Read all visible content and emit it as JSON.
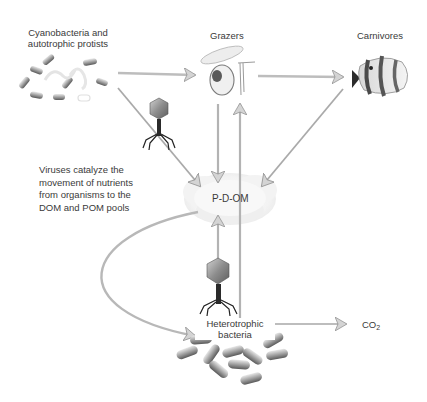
{
  "diagram": {
    "nodes": {
      "cyanobacteria": {
        "line1": "Cyanobacteria and",
        "line2": "autotrophic protists"
      },
      "grazers": {
        "label": "Grazers"
      },
      "carnivores": {
        "label": "Carnivores"
      },
      "pdom": {
        "label": "P-D-OM"
      },
      "heterotrophic": {
        "line1": "Heterotrophic",
        "line2": "bacteria"
      },
      "co2": {
        "base": "CO",
        "sub": "2"
      }
    },
    "annotation": {
      "line1": "Viruses catalyze the",
      "line2": "movement of nutrients",
      "line3": "from organisms to the",
      "line4": "DOM and POM pools"
    },
    "edges": [
      {
        "from": "cyanobacteria",
        "to": "grazers"
      },
      {
        "from": "grazers",
        "to": "carnivores"
      },
      {
        "from": "cyanobacteria",
        "to": "pdom",
        "via": "virus"
      },
      {
        "from": "grazers",
        "to": "pdom"
      },
      {
        "from": "carnivores",
        "to": "pdom"
      },
      {
        "from": "heterotrophic",
        "to": "grazers"
      },
      {
        "from": "heterotrophic",
        "to": "pdom",
        "via": "virus"
      },
      {
        "from": "pdom",
        "to": "heterotrophic"
      },
      {
        "from": "heterotrophic",
        "to": "co2"
      }
    ],
    "colors": {
      "arrow": "#b8b8b8",
      "arrow_stroke": "#8a8a8a",
      "text": "#3a3a3a",
      "cloud": "#f1f1f1"
    }
  }
}
